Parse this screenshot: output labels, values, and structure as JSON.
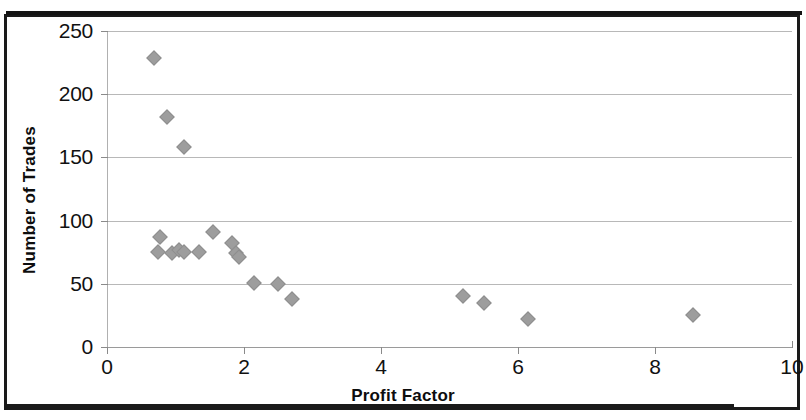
{
  "chart_data": {
    "type": "scatter",
    "title": "",
    "xlabel": "Profit Factor",
    "ylabel": "Number of Trades",
    "xlim": [
      0,
      10
    ],
    "ylim": [
      0,
      250
    ],
    "xticks": [
      0,
      2,
      4,
      6,
      8,
      10
    ],
    "yticks": [
      0,
      50,
      100,
      150,
      200,
      250
    ],
    "grid": "horizontal",
    "legend": "none",
    "marker": "diamond",
    "marker_color": "#9d9d9d",
    "points": [
      {
        "x": 0.68,
        "y": 229
      },
      {
        "x": 0.88,
        "y": 182
      },
      {
        "x": 1.12,
        "y": 158
      },
      {
        "x": 0.78,
        "y": 87
      },
      {
        "x": 0.75,
        "y": 75
      },
      {
        "x": 0.95,
        "y": 74
      },
      {
        "x": 1.05,
        "y": 77
      },
      {
        "x": 1.12,
        "y": 75
      },
      {
        "x": 1.35,
        "y": 75
      },
      {
        "x": 1.55,
        "y": 91
      },
      {
        "x": 1.82,
        "y": 82
      },
      {
        "x": 1.88,
        "y": 74
      },
      {
        "x": 1.92,
        "y": 71
      },
      {
        "x": 2.15,
        "y": 51
      },
      {
        "x": 2.5,
        "y": 50
      },
      {
        "x": 2.7,
        "y": 38
      },
      {
        "x": 5.2,
        "y": 40
      },
      {
        "x": 5.5,
        "y": 35
      },
      {
        "x": 6.15,
        "y": 22
      },
      {
        "x": 8.55,
        "y": 25
      }
    ]
  },
  "axes": {
    "x_tick_labels": [
      "0",
      "2",
      "4",
      "6",
      "8",
      "10"
    ],
    "y_tick_labels": [
      "0",
      "50",
      "100",
      "150",
      "200",
      "250"
    ],
    "x_axis_title": "Profit Factor",
    "y_axis_title": "Number of Trades"
  }
}
